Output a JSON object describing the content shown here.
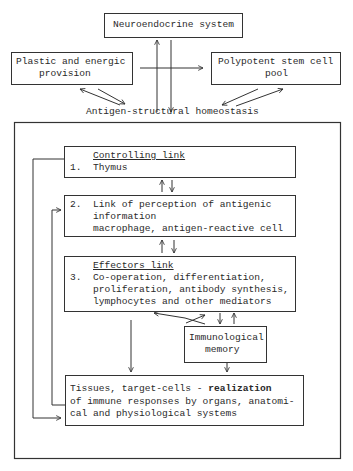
{
  "diagram": {
    "top": {
      "neuroendocrine": "Neuroendocrine system",
      "plastic_line1": "Plastic and energic",
      "plastic_line2": "provision",
      "stem_line1": "Polypotent stem cell",
      "stem_line2": "pool",
      "homeostasis": "Antigen-structural homeostasis"
    },
    "links": [
      {
        "number": "1.",
        "title": "Controlling link",
        "lines": [
          "Thymus"
        ]
      },
      {
        "number": "2.",
        "title": "Link of perception of antigenic",
        "lines": [
          "information",
          "macrophage, antigen-reactive cell"
        ]
      },
      {
        "number": "3.",
        "title": "Effectors link",
        "lines": [
          "Co-operation, differentiation,",
          "proliferation, antibody synthesis,",
          "lymphocytes and other mediators"
        ]
      }
    ],
    "memory": {
      "line1": "Immunological",
      "line2": "memory"
    },
    "tissues": {
      "line1_a": "Tissues, target-cells - ",
      "line1_b": "realization",
      "line2": "of immune responses by organs, anatomi-",
      "line3": "cal and physiological systems"
    }
  }
}
